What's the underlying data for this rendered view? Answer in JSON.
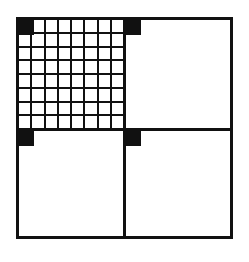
{
  "figure": {
    "quadrants": [
      {
        "id": "top-left",
        "grid": {
          "rows": 8,
          "cols": 8
        },
        "marker": true
      },
      {
        "id": "top-right",
        "grid": null,
        "marker": true
      },
      {
        "id": "bottom-left",
        "grid": null,
        "marker": true
      },
      {
        "id": "bottom-right",
        "grid": null,
        "marker": true
      }
    ],
    "colors": {
      "line": "#111111",
      "fill": "#ffffff",
      "marker": "#111111"
    }
  }
}
